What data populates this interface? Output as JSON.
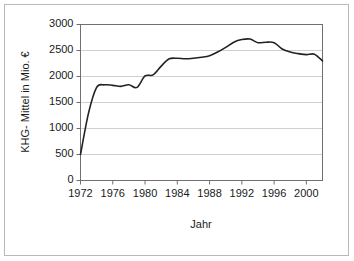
{
  "figure": {
    "border_color": "#b9b9b9",
    "background": "#ffffff"
  },
  "chart_data": {
    "type": "line",
    "title": "",
    "xlabel": "Jahr",
    "ylabel": "KHG- Mittel in Mio. €",
    "xlim": [
      1972,
      2002
    ],
    "ylim": [
      0,
      3000
    ],
    "grid": true,
    "legend": null,
    "line_color": "#222222",
    "xticks": [
      1972,
      1976,
      1980,
      1984,
      1988,
      1992,
      1996,
      2000
    ],
    "xtick_labels": [
      "1972",
      "1976",
      "1980",
      "1984",
      "1988",
      "1992",
      "1996",
      "2000"
    ],
    "yticks": [
      0,
      500,
      1000,
      1500,
      2000,
      2500,
      3000
    ],
    "ytick_labels": [
      "0",
      "500",
      "1000",
      "1500",
      "2000",
      "2500",
      "3000"
    ],
    "x": [
      1972,
      1973,
      1974,
      1975,
      1976,
      1977,
      1978,
      1979,
      1980,
      1981,
      1982,
      1983,
      1984,
      1985,
      1986,
      1987,
      1988,
      1989,
      1990,
      1991,
      1992,
      1993,
      1994,
      1995,
      1996,
      1997,
      1998,
      1999,
      2000,
      2001,
      2002
    ],
    "values": [
      500,
      1300,
      1790,
      1840,
      1830,
      1810,
      1840,
      1790,
      2010,
      2030,
      2200,
      2340,
      2350,
      2340,
      2350,
      2370,
      2400,
      2470,
      2560,
      2660,
      2710,
      2720,
      2650,
      2660,
      2650,
      2530,
      2470,
      2440,
      2420,
      2430,
      2300
    ]
  },
  "axis_titles": {
    "x": "Jahr",
    "y": "KHG- Mittel in Mio. €"
  }
}
